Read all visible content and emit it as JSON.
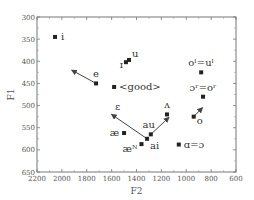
{
  "chart_data": {
    "type": "scatter",
    "title": "",
    "xlabel": "F2",
    "ylabel": "F1",
    "xlim": [
      2200,
      600
    ],
    "ylim": [
      650,
      300
    ],
    "x_reversed": true,
    "y_reversed": true,
    "grid": false,
    "xticks": [
      2200,
      2000,
      1800,
      1600,
      1400,
      1200,
      1000,
      800,
      600
    ],
    "yticks": [
      300,
      350,
      400,
      450,
      500,
      550,
      600,
      650
    ],
    "points": [
      {
        "label": "i",
        "F2": 2055,
        "F1": 345
      },
      {
        "label": "ɪ",
        "F2": 1485,
        "F1": 402
      },
      {
        "label": "u",
        "F2": 1460,
        "F1": 397
      },
      {
        "label": "e",
        "F2": 1725,
        "F1": 450,
        "arrow_to": {
          "F2": 1920,
          "F1": 420
        }
      },
      {
        "label": "<good>",
        "F2": 1580,
        "F1": 458
      },
      {
        "label": "oˡ=uˡ",
        "F2": 880,
        "F1": 425
      },
      {
        "label": "ɔʳ=oʳ",
        "F2": 865,
        "F1": 480
      },
      {
        "label": "o",
        "F2": 940,
        "F1": 525,
        "arrow_to": {
          "F2": 870,
          "F1": 505
        }
      },
      {
        "label": "ʌ",
        "F2": 1155,
        "F1": 520
      },
      {
        "label": "ɑ=ɔ",
        "F2": 1060,
        "F1": 588
      },
      {
        "label": "au",
        "F2": 1285,
        "F1": 565,
        "arrow_to": {
          "F2": 1140,
          "F1": 527
        }
      },
      {
        "label": "ai",
        "F2": 1315,
        "F1": 575,
        "arrow_to": {
          "F2": 1600,
          "F1": 520
        }
      },
      {
        "label": "æᴺ",
        "F2": 1360,
        "F1": 587
      },
      {
        "label": "æ",
        "F2": 1500,
        "F1": 562
      },
      {
        "label": "ɛ",
        "F2": 1600,
        "F1": 520,
        "marker": "arrowhead"
      }
    ]
  },
  "axes": {
    "xlabel": "F2",
    "ylabel": "F1"
  }
}
